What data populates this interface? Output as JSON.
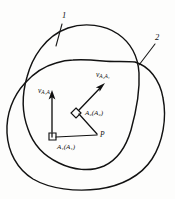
{
  "figure": {
    "background_color": "#fdfdfc",
    "ink_color": "#121212",
    "curve_labels": {
      "outer_curve": "2",
      "inner_curve": "1"
    },
    "vectors": {
      "left_vertical": {
        "symbol": "v",
        "subscript": "A₁A₁",
        "direction": "up"
      },
      "diagonal": {
        "symbol": "v",
        "subscript": "A₂A₁",
        "direction": "up-right"
      }
    },
    "nodes": {
      "origin_node": {
        "symbol": "A",
        "subscript": "1",
        "paren_symbol": "A",
        "paren_subscript": "1",
        "text": "A₁(A₁)",
        "marker": "right-angle-square"
      },
      "center_node": {
        "symbol": "A",
        "subscript": "2",
        "paren_symbol": "A",
        "paren_subscript": "2",
        "text": "A₂(A₂)",
        "marker": "diamond"
      },
      "point_p": {
        "text": "P"
      }
    }
  }
}
